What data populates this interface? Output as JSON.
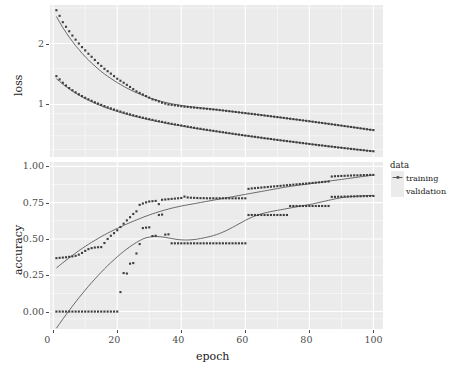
{
  "chart_data": {
    "type": "line",
    "title": "",
    "subtitle": "",
    "xlabel": "epoch",
    "facets": [
      {
        "name": "loss",
        "ylabel": "loss",
        "yscale": "log",
        "ytick_labels": [
          "2",
          "1"
        ],
        "ytick_values": [
          2,
          1
        ],
        "ylim": [
          0.55,
          3.1
        ],
        "grid": true
      },
      {
        "name": "accuracy",
        "ylabel": "accuracy",
        "yscale": "linear",
        "ytick_labels": [
          "0.00",
          "0.25",
          "0.50",
          "0.75",
          "1.00"
        ],
        "ytick_values": [
          0.0,
          0.25,
          0.5,
          0.75,
          1.0
        ],
        "ylim": [
          -0.12,
          1.03
        ],
        "grid": true
      }
    ],
    "xtick_labels": [
      "0",
      "20",
      "40",
      "60",
      "80",
      "100"
    ],
    "xtick_values": [
      0,
      20,
      40,
      60,
      80,
      100
    ],
    "xlim": [
      -1,
      103
    ],
    "legend": {
      "title": "data",
      "position": "right",
      "entries": [
        {
          "label": "training",
          "color": "#4d4d4d"
        },
        {
          "label": "validation",
          "color": "#4d4d4d"
        }
      ]
    },
    "x": [
      1,
      2,
      3,
      4,
      5,
      6,
      7,
      8,
      9,
      10,
      11,
      12,
      13,
      14,
      15,
      16,
      17,
      18,
      19,
      20,
      21,
      22,
      23,
      24,
      25,
      26,
      27,
      28,
      29,
      30,
      31,
      32,
      33,
      34,
      35,
      36,
      37,
      38,
      39,
      40,
      41,
      42,
      43,
      44,
      45,
      46,
      47,
      48,
      49,
      50,
      51,
      52,
      53,
      54,
      55,
      56,
      57,
      58,
      59,
      60,
      61,
      62,
      63,
      64,
      65,
      66,
      67,
      68,
      69,
      70,
      71,
      72,
      73,
      74,
      75,
      76,
      77,
      78,
      79,
      80,
      81,
      82,
      83,
      84,
      85,
      86,
      87,
      88,
      89,
      90,
      91,
      92,
      93,
      94,
      95,
      96,
      97,
      98,
      99,
      100
    ],
    "series": [
      {
        "facet": "loss",
        "name": "validation",
        "points": [
          2.92,
          2.74,
          2.55,
          2.42,
          2.3,
          2.19,
          2.09,
          2.0,
          1.92,
          1.85,
          1.78,
          1.72,
          1.66,
          1.6,
          1.55,
          1.5,
          1.46,
          1.42,
          1.38,
          1.34,
          1.31,
          1.28,
          1.25,
          1.22,
          1.19,
          1.16,
          1.14,
          1.12,
          1.1,
          1.08,
          1.06,
          1.05,
          1.035,
          1.02,
          1.01,
          1.0,
          0.995,
          0.99,
          0.985,
          0.98,
          0.975,
          0.972,
          0.968,
          0.965,
          0.962,
          0.958,
          0.955,
          0.952,
          0.948,
          0.945,
          0.942,
          0.938,
          0.934,
          0.93,
          0.926,
          0.922,
          0.918,
          0.914,
          0.91,
          0.906,
          0.902,
          0.898,
          0.894,
          0.89,
          0.886,
          0.882,
          0.878,
          0.874,
          0.87,
          0.866,
          0.862,
          0.858,
          0.854,
          0.85,
          0.846,
          0.842,
          0.838,
          0.834,
          0.83,
          0.826,
          0.822,
          0.818,
          0.814,
          0.81,
          0.806,
          0.802,
          0.798,
          0.794,
          0.79,
          0.786,
          0.782,
          0.778,
          0.774,
          0.77,
          0.766,
          0.762,
          0.758,
          0.754,
          0.75,
          0.747
        ],
        "smooth": [
          2.72,
          2.55,
          2.4,
          2.27,
          2.15,
          2.05,
          1.95,
          1.87,
          1.79,
          1.72,
          1.66,
          1.6,
          1.55,
          1.5,
          1.455,
          1.415,
          1.378,
          1.344,
          1.312,
          1.282,
          1.255,
          1.229,
          1.205,
          1.183,
          1.162,
          1.143,
          1.125,
          1.108,
          1.093,
          1.079,
          1.066,
          1.054,
          1.043,
          1.033,
          1.024,
          1.016,
          1.008,
          1.001,
          0.995,
          0.989,
          0.984,
          0.979,
          0.974,
          0.97,
          0.966,
          0.962,
          0.958,
          0.954,
          0.95,
          0.946,
          0.942,
          0.938,
          0.934,
          0.93,
          0.926,
          0.922,
          0.918,
          0.914,
          0.91,
          0.906,
          0.902,
          0.898,
          0.894,
          0.89,
          0.886,
          0.882,
          0.878,
          0.874,
          0.87,
          0.866,
          0.862,
          0.858,
          0.854,
          0.85,
          0.846,
          0.842,
          0.838,
          0.834,
          0.83,
          0.826,
          0.822,
          0.818,
          0.814,
          0.81,
          0.806,
          0.802,
          0.798,
          0.794,
          0.79,
          0.786,
          0.782,
          0.778,
          0.774,
          0.77,
          0.766,
          0.762,
          0.758,
          0.754,
          0.75,
          0.747
        ]
      },
      {
        "facet": "loss",
        "name": "training",
        "points": [
          1.38,
          1.33,
          1.28,
          1.24,
          1.205,
          1.175,
          1.148,
          1.123,
          1.1,
          1.079,
          1.06,
          1.042,
          1.025,
          1.01,
          0.995,
          0.981,
          0.968,
          0.956,
          0.944,
          0.933,
          0.922,
          0.912,
          0.902,
          0.893,
          0.884,
          0.876,
          0.868,
          0.86,
          0.853,
          0.846,
          0.839,
          0.832,
          0.826,
          0.82,
          0.814,
          0.808,
          0.802,
          0.797,
          0.792,
          0.787,
          0.782,
          0.777,
          0.772,
          0.767,
          0.762,
          0.758,
          0.753,
          0.749,
          0.745,
          0.741,
          0.737,
          0.733,
          0.729,
          0.725,
          0.721,
          0.717,
          0.713,
          0.71,
          0.706,
          0.702,
          0.699,
          0.695,
          0.692,
          0.688,
          0.685,
          0.681,
          0.678,
          0.675,
          0.671,
          0.668,
          0.665,
          0.662,
          0.659,
          0.656,
          0.653,
          0.65,
          0.647,
          0.644,
          0.641,
          0.638,
          0.635,
          0.632,
          0.629,
          0.627,
          0.624,
          0.621,
          0.619,
          0.616,
          0.613,
          0.611,
          0.608,
          0.606,
          0.603,
          0.601,
          0.598,
          0.596,
          0.594,
          0.591,
          0.589,
          0.587
        ],
        "smooth": [
          1.34,
          1.3,
          1.26,
          1.225,
          1.193,
          1.164,
          1.137,
          1.112,
          1.089,
          1.068,
          1.049,
          1.031,
          1.014,
          0.999,
          0.984,
          0.97,
          0.957,
          0.945,
          0.934,
          0.923,
          0.913,
          0.903,
          0.894,
          0.885,
          0.877,
          0.869,
          0.861,
          0.854,
          0.847,
          0.84,
          0.833,
          0.827,
          0.821,
          0.815,
          0.809,
          0.803,
          0.798,
          0.793,
          0.788,
          0.783,
          0.778,
          0.773,
          0.768,
          0.764,
          0.759,
          0.755,
          0.751,
          0.747,
          0.743,
          0.739,
          0.735,
          0.731,
          0.727,
          0.723,
          0.719,
          0.716,
          0.712,
          0.708,
          0.705,
          0.701,
          0.698,
          0.694,
          0.691,
          0.688,
          0.684,
          0.681,
          0.678,
          0.675,
          0.671,
          0.668,
          0.665,
          0.662,
          0.659,
          0.656,
          0.653,
          0.65,
          0.647,
          0.644,
          0.641,
          0.638,
          0.635,
          0.633,
          0.63,
          0.627,
          0.624,
          0.622,
          0.619,
          0.616,
          0.614,
          0.611,
          0.609,
          0.606,
          0.604,
          0.601,
          0.599,
          0.596,
          0.594,
          0.592,
          0.589,
          0.587
        ]
      },
      {
        "facet": "accuracy",
        "name": "training",
        "points": [
          0.368,
          0.37,
          0.372,
          0.374,
          0.377,
          0.38,
          0.384,
          0.392,
          0.404,
          0.418,
          0.43,
          0.437,
          0.441,
          0.443,
          0.444,
          0.472,
          0.5,
          0.522,
          0.54,
          0.56,
          0.582,
          0.605,
          0.628,
          0.65,
          0.672,
          0.69,
          0.735,
          0.744,
          0.752,
          0.758,
          0.76,
          0.762,
          0.74,
          0.77,
          0.772,
          0.774,
          0.776,
          0.778,
          0.78,
          0.782,
          0.792,
          0.786,
          0.784,
          0.783,
          0.782,
          0.781,
          0.781,
          0.78,
          0.78,
          0.78,
          0.78,
          0.78,
          0.78,
          0.78,
          0.78,
          0.78,
          0.78,
          0.78,
          0.78,
          0.78,
          0.845,
          0.848,
          0.85,
          0.852,
          0.854,
          0.856,
          0.858,
          0.86,
          0.862,
          0.864,
          0.866,
          0.868,
          0.87,
          0.872,
          0.874,
          0.876,
          0.878,
          0.88,
          0.882,
          0.884,
          0.886,
          0.888,
          0.89,
          0.892,
          0.894,
          0.896,
          0.93,
          0.932,
          0.933,
          0.934,
          0.935,
          0.936,
          0.937,
          0.938,
          0.938,
          0.939,
          0.94,
          0.94,
          0.941,
          0.941
        ],
        "smooth": [
          0.3,
          0.318,
          0.336,
          0.353,
          0.37,
          0.387,
          0.403,
          0.419,
          0.434,
          0.449,
          0.463,
          0.477,
          0.49,
          0.503,
          0.516,
          0.528,
          0.54,
          0.551,
          0.562,
          0.573,
          0.583,
          0.593,
          0.603,
          0.613,
          0.622,
          0.631,
          0.64,
          0.649,
          0.657,
          0.665,
          0.673,
          0.68,
          0.687,
          0.694,
          0.7,
          0.706,
          0.712,
          0.717,
          0.722,
          0.727,
          0.731,
          0.735,
          0.739,
          0.743,
          0.747,
          0.751,
          0.755,
          0.759,
          0.763,
          0.767,
          0.771,
          0.775,
          0.779,
          0.783,
          0.787,
          0.791,
          0.795,
          0.799,
          0.803,
          0.807,
          0.811,
          0.815,
          0.819,
          0.823,
          0.827,
          0.831,
          0.835,
          0.839,
          0.843,
          0.847,
          0.851,
          0.855,
          0.859,
          0.862,
          0.865,
          0.868,
          0.871,
          0.874,
          0.877,
          0.88,
          0.883,
          0.886,
          0.889,
          0.892,
          0.895,
          0.898,
          0.901,
          0.904,
          0.907,
          0.91,
          0.913,
          0.916,
          0.919,
          0.922,
          0.925,
          0.928,
          0.931,
          0.934,
          0.937,
          0.94
        ]
      },
      {
        "facet": "accuracy",
        "name": "validation",
        "points": [
          0.0,
          0.0,
          0.0,
          0.0,
          0.0,
          0.0,
          0.0,
          0.0,
          0.0,
          0.0,
          0.0,
          0.0,
          0.0,
          0.0,
          0.0,
          0.0,
          0.0,
          0.0,
          0.0,
          0.0,
          0.134,
          0.265,
          0.262,
          0.33,
          0.334,
          0.4,
          0.465,
          0.575,
          0.578,
          0.58,
          0.52,
          0.522,
          0.665,
          0.668,
          0.53,
          0.532,
          0.47,
          0.47,
          0.47,
          0.47,
          0.47,
          0.47,
          0.47,
          0.47,
          0.47,
          0.47,
          0.47,
          0.47,
          0.47,
          0.47,
          0.47,
          0.47,
          0.47,
          0.47,
          0.47,
          0.47,
          0.47,
          0.47,
          0.47,
          0.47,
          0.665,
          0.665,
          0.665,
          0.665,
          0.665,
          0.665,
          0.665,
          0.665,
          0.665,
          0.665,
          0.665,
          0.665,
          0.665,
          0.727,
          0.727,
          0.727,
          0.727,
          0.727,
          0.727,
          0.727,
          0.727,
          0.727,
          0.727,
          0.727,
          0.727,
          0.727,
          0.79,
          0.79,
          0.791,
          0.791,
          0.792,
          0.792,
          0.793,
          0.793,
          0.794,
          0.794,
          0.795,
          0.795,
          0.796,
          0.796
        ],
        "smooth": [
          -0.115,
          -0.083,
          -0.052,
          -0.022,
          0.008,
          0.037,
          0.066,
          0.094,
          0.121,
          0.148,
          0.174,
          0.199,
          0.224,
          0.248,
          0.271,
          0.294,
          0.316,
          0.337,
          0.357,
          0.377,
          0.396,
          0.414,
          0.431,
          0.447,
          0.462,
          0.476,
          0.489,
          0.5,
          0.508,
          0.513,
          0.516,
          0.517,
          0.516,
          0.514,
          0.511,
          0.507,
          0.503,
          0.499,
          0.496,
          0.494,
          0.493,
          0.493,
          0.494,
          0.496,
          0.499,
          0.503,
          0.507,
          0.512,
          0.517,
          0.523,
          0.53,
          0.538,
          0.547,
          0.557,
          0.568,
          0.58,
          0.592,
          0.604,
          0.616,
          0.628,
          0.639,
          0.649,
          0.658,
          0.666,
          0.673,
          0.679,
          0.684,
          0.689,
          0.693,
          0.697,
          0.701,
          0.705,
          0.709,
          0.713,
          0.717,
          0.721,
          0.725,
          0.729,
          0.733,
          0.737,
          0.741,
          0.746,
          0.751,
          0.756,
          0.761,
          0.766,
          0.771,
          0.776,
          0.78,
          0.784,
          0.787,
          0.79,
          0.792,
          0.794,
          0.795,
          0.796,
          0.797,
          0.798,
          0.799,
          0.8
        ]
      }
    ]
  }
}
